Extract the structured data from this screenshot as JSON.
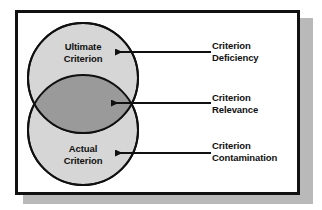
{
  "figure": {
    "frame": {
      "border_color": "#111111",
      "background_color": "#ffffff",
      "shadow_color": "#b9b9b9"
    }
  },
  "venn": {
    "circle_fill": "#d6d6d6",
    "overlap_fill": "#9a9a9a",
    "outline_color": "#101010",
    "circles": [
      {
        "id": "ultimate-criterion",
        "label_line_1": "Ultimate",
        "label_line_2": "Criterion"
      },
      {
        "id": "actual-criterion",
        "label_line_1": "Actual",
        "label_line_2": "Criterion"
      }
    ]
  },
  "callouts": [
    {
      "id": "criterion-deficiency",
      "line_1": "Criterion",
      "line_2": "Deficiency",
      "points_to": "ultimate-criterion"
    },
    {
      "id": "criterion-relevance",
      "line_1": "Criterion",
      "line_2": "Relevance",
      "points_to": "overlap"
    },
    {
      "id": "criterion-contamination",
      "line_1": "Criterion",
      "line_2": "Contamination",
      "points_to": "actual-criterion"
    }
  ]
}
